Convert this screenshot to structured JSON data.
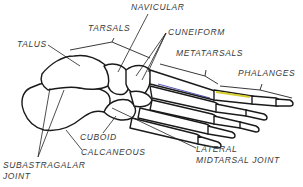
{
  "diagram": {
    "colors": {
      "outline": "#1a1a1a",
      "label": "#3a3a3a",
      "accent_blue": "#2a2aa0",
      "accent_yellow": "#d8d030",
      "accent_red": "#c04040"
    },
    "labels": {
      "navicular": "NAVICULAR",
      "tarsals": "TARSALS",
      "cuneiform": "CUNEIFORM",
      "talus": "TALUS",
      "metatarsals": "METATARSALS",
      "phalanges": "PHALANGES",
      "cuboid": "CUBOID",
      "calcaneous": "CALCANEOUS",
      "subastragalar_line1": "SUBASTRAGALAR",
      "subastragalar_line2": "JOINT",
      "lateral_line1": "LATERAL",
      "lateral_line2": "MIDTARSAL JOINT"
    }
  }
}
